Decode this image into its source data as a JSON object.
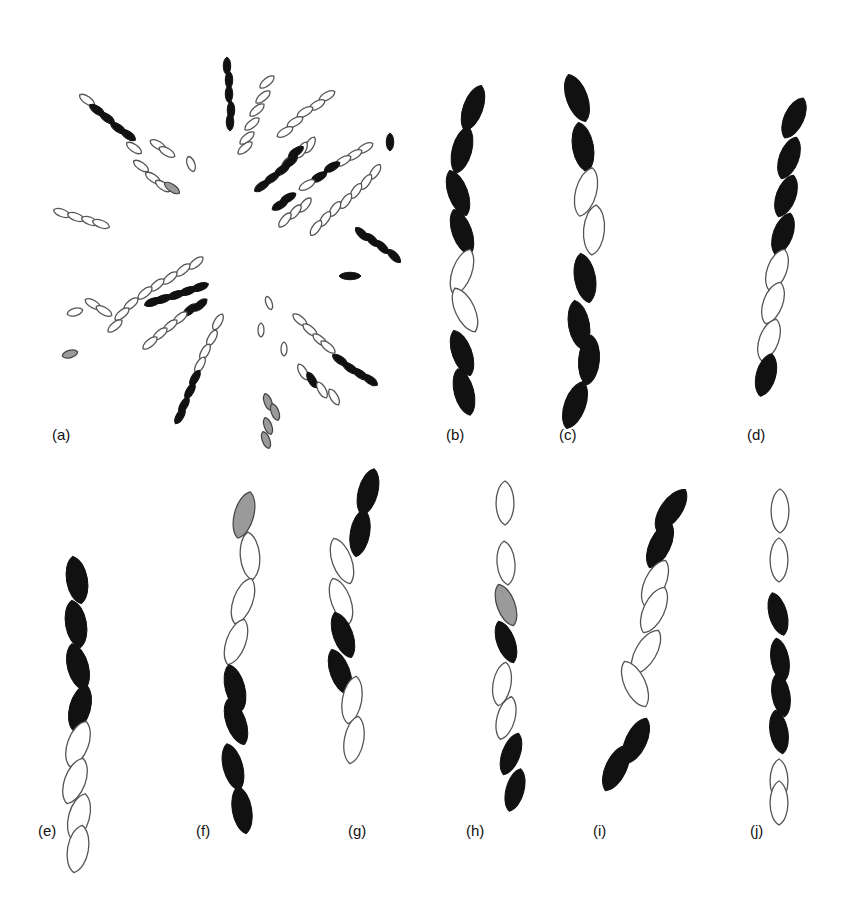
{
  "figure": {
    "colors": {
      "dark": "#111111",
      "light_fill": "#ffffff",
      "outline": "#555555",
      "gray": "#888888"
    },
    "panels": [
      {
        "id": "a",
        "label": "(a)",
        "label_pos": [
          52,
          438
        ],
        "type": "rosette"
      },
      {
        "id": "b",
        "label": "(b)",
        "label_pos": [
          446,
          438
        ],
        "pattern": [
          "dark",
          "dark",
          "dark",
          "dark",
          "light",
          "light",
          "dark",
          "dark"
        ]
      },
      {
        "id": "c",
        "label": "(c)",
        "label_pos": [
          559,
          438
        ],
        "pattern": [
          "dark",
          "dark",
          "light",
          "light",
          "dark",
          "dark",
          "dark",
          "dark"
        ]
      },
      {
        "id": "d",
        "label": "(d)",
        "label_pos": [
          747,
          438
        ],
        "pattern": [
          "dark",
          "dark",
          "dark",
          "dark",
          "light",
          "light",
          "light",
          "dark"
        ]
      },
      {
        "id": "e",
        "label": "(e)",
        "label_pos": [
          38,
          834
        ],
        "pattern": [
          "dark",
          "dark",
          "dark",
          "dark",
          "light",
          "light",
          "light",
          "light"
        ]
      },
      {
        "id": "f",
        "label": "(f)",
        "label_pos": [
          196,
          834
        ],
        "pattern": [
          "gray",
          "light",
          "light",
          "light",
          "dark",
          "dark",
          "dark",
          "dark"
        ]
      },
      {
        "id": "g",
        "label": "(g)",
        "label_pos": [
          348,
          834
        ],
        "pattern": [
          "dark",
          "dark",
          "light",
          "light",
          "dark",
          "dark",
          "light",
          "light"
        ]
      },
      {
        "id": "h",
        "label": "(h)",
        "label_pos": [
          466,
          834
        ],
        "pattern": [
          "light",
          "light",
          "gray",
          "dark",
          "light",
          "light",
          "dark",
          "dark"
        ]
      },
      {
        "id": "i",
        "label": "(i)",
        "label_pos": [
          593,
          834
        ],
        "pattern": [
          "dark",
          "dark",
          "light",
          "light",
          "light",
          "light",
          "dark",
          "dark"
        ]
      },
      {
        "id": "j",
        "label": "(j)",
        "label_pos": [
          750,
          834
        ],
        "pattern": [
          "light",
          "light",
          "dark",
          "dark",
          "dark",
          "dark",
          "light",
          "light"
        ]
      }
    ]
  }
}
